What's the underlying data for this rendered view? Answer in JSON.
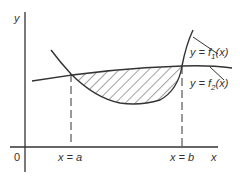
{
  "diagram": {
    "axes": {
      "y_label": "y",
      "x_label": "x",
      "origin_label": "0"
    },
    "bounds": {
      "a_label": "x = a",
      "b_label": "x = b"
    },
    "curves": [
      {
        "id": "f1",
        "label_prefix": "y = f",
        "subscript": "1",
        "label_suffix": "(x)",
        "shape": "upward parabola"
      },
      {
        "id": "f2",
        "label_prefix": "y = f",
        "subscript": "2",
        "label_suffix": "(x)",
        "shape": "nearly flat line"
      }
    ],
    "shaded_region": "area between f2 (top) and f1 (bottom) from x=a to x=b",
    "colors": {
      "line": "#333333",
      "background": "#ffffff"
    }
  }
}
